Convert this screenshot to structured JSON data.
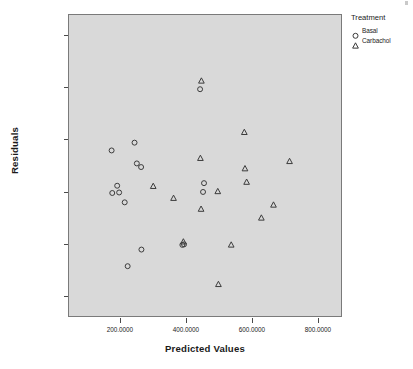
{
  "chart_data": {
    "type": "scatter",
    "title": "",
    "xlabel": "Predicted Values",
    "ylabel": "Residuals",
    "xlim": [
      43.0,
      873.0
    ],
    "ylim": [
      -48.0,
      68.0
    ],
    "grid": false,
    "background": "#d9d9d9",
    "legend": {
      "title": "Treatment",
      "position": "top-right-outside",
      "entries": [
        {
          "name": "Basal",
          "marker": "circle-open"
        },
        {
          "name": "Carbachol",
          "marker": "triangle-open"
        }
      ]
    },
    "xticks": [
      {
        "value": 200,
        "label": "200.0000"
      },
      {
        "value": 400,
        "label": "400.0000"
      },
      {
        "value": 600,
        "label": "600.0000"
      },
      {
        "value": 800,
        "label": "800.0000"
      }
    ],
    "yticks": [
      {
        "value": 60,
        "label": "60.0000"
      },
      {
        "value": 40,
        "label": "40.0000"
      },
      {
        "value": 20,
        "label": "20.0000"
      },
      {
        "value": 0,
        "label": ".0000"
      },
      {
        "value": -20,
        "label": "-20.0000"
      },
      {
        "value": -40,
        "label": "-40.0000"
      }
    ],
    "series": [
      {
        "name": "Basal",
        "marker": "circle-open",
        "color": "#3a3a3a",
        "points": [
          {
            "x": 173,
            "y": 15.8
          },
          {
            "x": 243,
            "y": 18.8
          },
          {
            "x": 250,
            "y": 10.8
          },
          {
            "x": 263,
            "y": 9.4
          },
          {
            "x": 190,
            "y": 2.2
          },
          {
            "x": 175,
            "y": -0.6
          },
          {
            "x": 196,
            "y": -0.4
          },
          {
            "x": 213,
            "y": -4.2
          },
          {
            "x": 264,
            "y": -22.4
          },
          {
            "x": 222,
            "y": -28.8
          },
          {
            "x": 389,
            "y": -20.6
          },
          {
            "x": 394,
            "y": -20.4
          },
          {
            "x": 443,
            "y": 39.4
          },
          {
            "x": 455,
            "y": 3.2
          },
          {
            "x": 452,
            "y": -0.2
          }
        ]
      },
      {
        "name": "Carbachol",
        "marker": "triangle-open",
        "color": "#3a3a3a",
        "points": [
          {
            "x": 447,
            "y": 42.6
          },
          {
            "x": 578,
            "y": 22.8
          },
          {
            "x": 716,
            "y": 11.6
          },
          {
            "x": 444,
            "y": 12.8
          },
          {
            "x": 580,
            "y": 8.8
          },
          {
            "x": 585,
            "y": 3.6
          },
          {
            "x": 300,
            "y": 2.0
          },
          {
            "x": 497,
            "y": 0.0
          },
          {
            "x": 362,
            "y": -2.6
          },
          {
            "x": 446,
            "y": -6.8
          },
          {
            "x": 667,
            "y": -5.2
          },
          {
            "x": 630,
            "y": -10.2
          },
          {
            "x": 392,
            "y": -19.4
          },
          {
            "x": 538,
            "y": -20.6
          },
          {
            "x": 499,
            "y": -35.8
          }
        ]
      }
    ]
  }
}
